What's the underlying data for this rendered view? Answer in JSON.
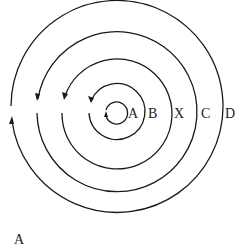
{
  "diagram": {
    "center": {
      "x": 117,
      "y": 113
    },
    "stroke_color": "#1a1a1a",
    "circles": [
      {
        "label": "A",
        "radius": 11,
        "arrow_dir": "up"
      },
      {
        "label": "B",
        "radius": 28,
        "arrow_dir": "down"
      },
      {
        "label": "X",
        "radius": 55,
        "arrow_dir": "down"
      },
      {
        "label": "C",
        "radius": 80,
        "arrow_dir": "down"
      },
      {
        "label": "D",
        "radius": 106,
        "arrow_dir": "up"
      }
    ],
    "caption": "A"
  }
}
